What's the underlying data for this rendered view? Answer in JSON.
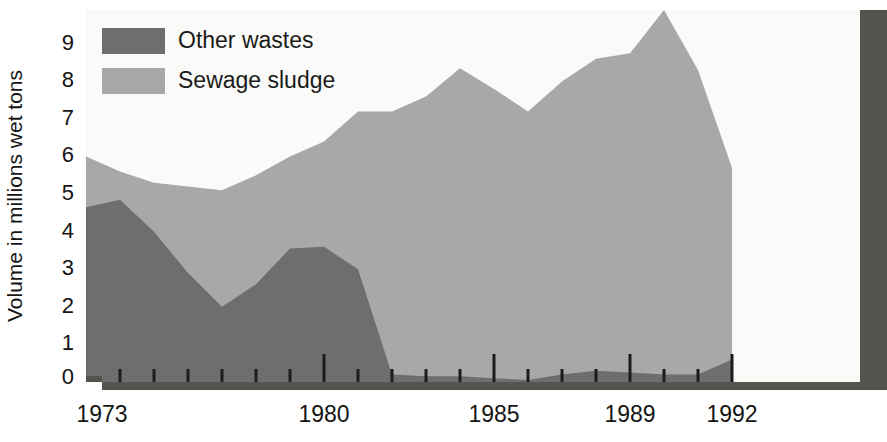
{
  "chart_data": {
    "type": "area",
    "stacked": true,
    "title": "",
    "subtitle": "",
    "xlabel": "",
    "ylabel": "Volume in millions wet tons",
    "x": [
      1973,
      1974,
      1975,
      1976,
      1977,
      1978,
      1979,
      1980,
      1981,
      1982,
      1983,
      1984,
      1985,
      1986,
      1987,
      1988,
      1989,
      1990,
      1991,
      1992
    ],
    "xlim": [
      1973,
      1996
    ],
    "ylim": [
      0,
      9.9
    ],
    "grid": false,
    "legend_position": "top-left",
    "x_tick_labels": [
      "1973",
      "1980",
      "1985",
      "1989",
      "1992"
    ],
    "x_tick_label_values": [
      1973,
      1980,
      1985,
      1989,
      1992
    ],
    "x_major_ticks": [
      1980,
      1985,
      1989,
      1992
    ],
    "x_minor_ticks": [
      1974,
      1975,
      1976,
      1977,
      1978,
      1979,
      1981,
      1982,
      1983,
      1984,
      1986,
      1987,
      1988,
      1990,
      1991
    ],
    "y_tick_labels": [
      "0",
      "1",
      "2",
      "3",
      "4",
      "5",
      "6",
      "7",
      "8",
      "9"
    ],
    "y_tick_values": [
      0,
      1,
      2,
      3,
      4,
      5,
      6,
      7,
      8,
      9
    ],
    "series": [
      {
        "name": "Other wastes",
        "color": "#6e6e6e",
        "values": [
          4.65,
          4.85,
          4.0,
          2.9,
          2.0,
          2.6,
          3.55,
          3.6,
          3.0,
          0.2,
          0.15,
          0.15,
          0.1,
          0.05,
          0.2,
          0.3,
          0.25,
          0.2,
          0.2,
          0.6
        ]
      },
      {
        "name": "Sewage sludge",
        "color": "#a8a8a8",
        "values": [
          1.35,
          0.75,
          1.3,
          2.3,
          3.1,
          2.9,
          2.45,
          2.8,
          4.2,
          7.0,
          7.45,
          8.2,
          7.7,
          7.15,
          7.8,
          8.3,
          8.5,
          9.7,
          8.1,
          5.1
        ]
      }
    ],
    "totals": [
      6.0,
      5.6,
      5.3,
      5.2,
      5.1,
      5.5,
      6.0,
      6.4,
      7.2,
      7.2,
      7.6,
      8.35,
      7.8,
      7.2,
      8.0,
      8.6,
      8.75,
      9.9,
      8.3,
      5.7
    ],
    "annotations": []
  },
  "legend": {
    "items": [
      {
        "label": "Other wastes",
        "color": "#6e6e6e"
      },
      {
        "label": "Sewage sludge",
        "color": "#a8a8a8"
      }
    ]
  },
  "axes": {
    "y_title": "Volume in millions wet tons",
    "y_ticks": [
      "9",
      "8",
      "7",
      "6",
      "5",
      "4",
      "3",
      "2",
      "1",
      "0"
    ],
    "x_ticks": [
      "1973",
      "1980",
      "1985",
      "1989",
      "1992"
    ]
  },
  "colors": {
    "other_wastes": "#6e6e6e",
    "sewage_sludge": "#a8a8a8",
    "frame": "#55544f",
    "plot_background": "#fafaf8",
    "page_background": "#ffffff",
    "text": "#141414",
    "tick": "#1c1c1c"
  }
}
